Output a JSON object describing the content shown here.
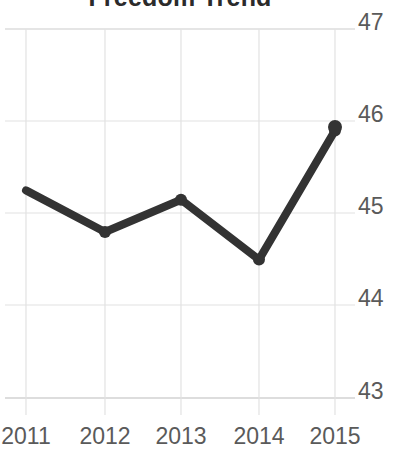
{
  "chart_data": {
    "type": "line",
    "title": "Freedom Trend",
    "xlabel": "",
    "ylabel": "",
    "categories": [
      "2011",
      "2012",
      "2013",
      "2014",
      "2015"
    ],
    "x": [
      2011,
      2012,
      2013,
      2014,
      2015
    ],
    "values": [
      45.25,
      44.8,
      45.15,
      44.5,
      45.9
    ],
    "series": [
      {
        "name": "Freedom Score",
        "values": [
          45.25,
          44.8,
          45.15,
          44.5,
          45.9
        ]
      }
    ],
    "ylim": [
      43,
      47
    ],
    "y_ticks": [
      47,
      46,
      45,
      44,
      43
    ],
    "y_tick_labels": [
      "47",
      "46",
      "45",
      "44",
      "43"
    ],
    "x_tick_labels": [
      "2011",
      "2012",
      "2013",
      "2014",
      "2015"
    ],
    "y_axis_position": "right",
    "grid": true,
    "grid_color": "#dcdcdc",
    "legend": false,
    "legend_position": "none",
    "line_color": "#333333",
    "marker": "circle",
    "marker_color": "#333333",
    "annotations": []
  },
  "axis": {
    "y_labels": [
      "47",
      "46",
      "45",
      "44",
      "43"
    ],
    "x_labels": [
      "2011",
      "2012",
      "2013",
      "2014",
      "2015"
    ]
  }
}
